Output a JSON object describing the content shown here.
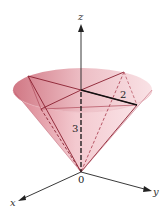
{
  "diagram": {
    "type": "cone-with-inscribed-square-pyramid",
    "axes": {
      "x_label": "x",
      "y_label": "y",
      "z_label": "z",
      "origin_label": "0"
    },
    "dimensions": {
      "radius_label": "2",
      "height_label": "3"
    },
    "colors": {
      "cone_fill": "#e8a5ae",
      "cone_edge": "#b04a5a",
      "pyramid_edge": "#8a1f30",
      "axis": "#222222",
      "radius_line": "#111111"
    }
  }
}
